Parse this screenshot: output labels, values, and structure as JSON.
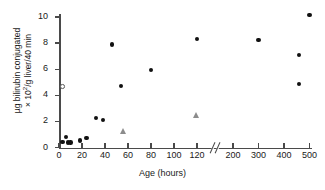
{
  "chart_data": {
    "type": "scatter",
    "title": "",
    "xlabel": "Age (hours)",
    "ylabel_line1": "µg bilirubin conjugated",
    "ylabel_line2_prefix": "× 10",
    "ylabel_line2_sup": "2",
    "ylabel_line2_suffix": "/g liver/40 min",
    "ylabel_plain": "µg bilirubin conjugated × 10²/g liver/40 min",
    "xticks": [
      0,
      20,
      40,
      60,
      80,
      100,
      120,
      200,
      300,
      400,
      500
    ],
    "xtick_labels": [
      "0",
      "20",
      "40",
      "60",
      "80",
      "100",
      "120",
      "200",
      "300",
      "400",
      "500"
    ],
    "yticks": [
      0,
      2,
      4,
      6,
      8,
      10
    ],
    "ytick_labels": [
      "0",
      "2",
      "4",
      "6",
      "8",
      "10"
    ],
    "xlim": [
      0,
      500
    ],
    "ylim": [
      0,
      10.8
    ],
    "grid": false,
    "axis_break": {
      "present": true,
      "between": [
        120,
        200
      ],
      "style": "double-slash"
    },
    "legend": {
      "present": false,
      "position": "none"
    },
    "series": [
      {
        "name": "filled-circle",
        "marker": "filled circle",
        "color": "#111111",
        "points": [
          {
            "x": 3,
            "y": 0.45
          },
          {
            "x": 6,
            "y": 0.8
          },
          {
            "x": 8,
            "y": 0.4
          },
          {
            "x": 10,
            "y": 0.4
          },
          {
            "x": 18,
            "y": 0.55
          },
          {
            "x": 24,
            "y": 0.75
          },
          {
            "x": 32,
            "y": 2.25
          },
          {
            "x": 38,
            "y": 2.1
          },
          {
            "x": 46,
            "y": 7.9
          },
          {
            "x": 54,
            "y": 4.7
          },
          {
            "x": 80,
            "y": 5.95
          },
          {
            "x": 120,
            "y": 8.3
          },
          {
            "x": 300,
            "y": 8.25
          },
          {
            "x": 460,
            "y": 7.1
          },
          {
            "x": 460,
            "y": 4.85
          },
          {
            "x": 500,
            "y": 10.15
          }
        ]
      },
      {
        "name": "open-circle",
        "marker": "open circle",
        "color": "#ffffff",
        "points": [
          {
            "x": 3,
            "y": 4.7
          }
        ]
      },
      {
        "name": "triangle",
        "marker": "filled triangle",
        "color": "#8c8c8c",
        "points": [
          {
            "x": 56,
            "y": 1.25
          },
          {
            "x": 120,
            "y": 2.45
          }
        ]
      }
    ]
  },
  "caption": ""
}
